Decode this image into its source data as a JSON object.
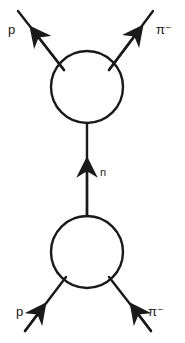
{
  "diagram": {
    "type": "feynman",
    "stroke_color": "#1a1a1a",
    "vertices": [
      {
        "id": "top-blob",
        "cx": 87,
        "cy": 87,
        "r": 36
      },
      {
        "id": "bottom-blob",
        "cx": 87,
        "cy": 252,
        "r": 36
      }
    ],
    "labels": {
      "top_left": "p",
      "top_right": "π⁻",
      "middle": "n",
      "bottom_left": "p",
      "bottom_right": "π⁻"
    },
    "edges": [
      {
        "from": "incoming-p",
        "to": "bottom-blob",
        "label": "p"
      },
      {
        "from": "incoming-pi-minus",
        "to": "bottom-blob",
        "label": "π⁻"
      },
      {
        "from": "bottom-blob",
        "to": "top-blob",
        "label": "n"
      },
      {
        "from": "top-blob",
        "to": "outgoing-p",
        "label": "p"
      },
      {
        "from": "top-blob",
        "to": "outgoing-pi-minus",
        "label": "π⁻"
      }
    ]
  }
}
